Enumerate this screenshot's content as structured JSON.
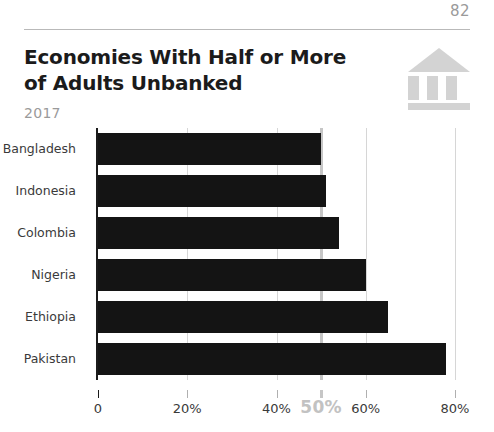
{
  "page": {
    "number": "82"
  },
  "header": {
    "title_line1": "Economies With Half or More",
    "title_line2": "of Adults Unbanked",
    "subtitle": "2017",
    "icon": "bank-icon"
  },
  "chart_data": {
    "type": "bar",
    "orientation": "horizontal",
    "title": "Economies With Half or More of Adults Unbanked",
    "subtitle": "2017",
    "xlabel": "",
    "ylabel": "",
    "xlim": [
      0,
      85.6
    ],
    "grid": true,
    "legend": null,
    "categories": [
      "Bangladesh",
      "Indonesia",
      "Colombia",
      "Nigeria",
      "Ethiopia",
      "Pakistan"
    ],
    "values": [
      50,
      51,
      54,
      60,
      65,
      78
    ],
    "value_unit": "%",
    "bar_color": "#141414",
    "xticks": [
      {
        "value": 0,
        "label": "0",
        "highlight": false
      },
      {
        "value": 20,
        "label": "20%",
        "highlight": false
      },
      {
        "value": 40,
        "label": "40%",
        "highlight": false
      },
      {
        "value": 50,
        "label": "50%",
        "highlight": true
      },
      {
        "value": 60,
        "label": "60%",
        "highlight": false
      },
      {
        "value": 80,
        "label": "80%",
        "highlight": false
      }
    ],
    "reference_line": {
      "value": 50,
      "label": "50%",
      "color": "#c6c6c6"
    }
  },
  "colors": {
    "bar": "#141414",
    "gridline": "#d6d6d6",
    "highlight": "#c6c6c6",
    "muted_text": "#9a9a9a",
    "icon": "#d3d3d3"
  }
}
